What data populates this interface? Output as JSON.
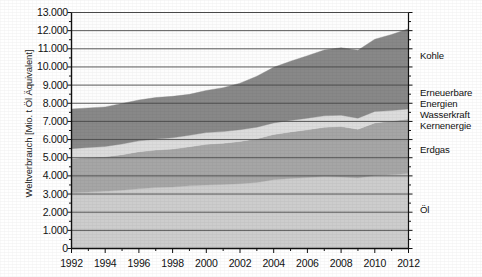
{
  "chart_data": {
    "type": "area",
    "title": "",
    "xlabel": "",
    "ylabel": "Weltverbrauch [Mio. t Öl Äquivalent]",
    "stacked": true,
    "grid": true,
    "legend_position": "right",
    "xlim": [
      1992,
      2012
    ],
    "ylim": [
      0,
      13000
    ],
    "ytick_labels": [
      "13.000",
      "12.000",
      "11.000",
      "10.000",
      "9.000",
      "8.000",
      "7.000",
      "6.000",
      "5.000",
      "4.000",
      "3.000",
      "2.000",
      "1.000",
      "0"
    ],
    "ytick_values": [
      13000,
      12000,
      11000,
      10000,
      9000,
      8000,
      7000,
      6000,
      5000,
      4000,
      3000,
      2000,
      1000,
      0
    ],
    "xtick_labels": [
      "1992",
      "1994",
      "1996",
      "1998",
      "2000",
      "2002",
      "2004",
      "2006",
      "2008",
      "2010",
      "2012"
    ],
    "xtick_values": [
      1992,
      1994,
      1996,
      1998,
      2000,
      2002,
      2004,
      2006,
      2008,
      2010,
      2012
    ],
    "x": [
      1992,
      1993,
      1994,
      1995,
      1996,
      1997,
      1998,
      1999,
      2000,
      2001,
      2002,
      2003,
      2004,
      2005,
      2006,
      2007,
      2008,
      2009,
      2010,
      2011,
      2012
    ],
    "series": [
      {
        "name": "Öl",
        "color": "#cdcdcd",
        "values": [
          3080,
          3110,
          3160,
          3210,
          3290,
          3360,
          3390,
          3450,
          3500,
          3530,
          3570,
          3640,
          3790,
          3860,
          3910,
          3960,
          3940,
          3890,
          4020,
          4060,
          4130
        ]
      },
      {
        "name": "Erdgas",
        "color": "#a6a6a6",
        "values": [
          1880,
          1900,
          1890,
          1960,
          2040,
          2060,
          2090,
          2150,
          2240,
          2270,
          2330,
          2410,
          2490,
          2560,
          2630,
          2720,
          2780,
          2680,
          2900,
          2960,
          3000
        ]
      },
      {
        "name": "Kernenergie",
        "color": "#dcdcdc",
        "values": [
          540,
          555,
          570,
          590,
          600,
          605,
          620,
          640,
          645,
          640,
          645,
          630,
          640,
          635,
          640,
          630,
          620,
          610,
          630,
          580,
          560
        ]
      },
      {
        "name": "Wasserkraft",
        "color": "#dcdcdc",
        "values": [
          0,
          0,
          0,
          0,
          0,
          0,
          0,
          0,
          0,
          0,
          0,
          0,
          0,
          0,
          0,
          0,
          0,
          0,
          0,
          0,
          0
        ]
      },
      {
        "name": "Erneuerbare Energien",
        "color": "#dcdcdc",
        "values": [
          0,
          0,
          0,
          0,
          0,
          0,
          0,
          0,
          0,
          0,
          0,
          0,
          0,
          0,
          0,
          0,
          0,
          0,
          0,
          0,
          0
        ]
      },
      {
        "name": "Kohle",
        "color": "#888888",
        "values": [
          2180,
          2180,
          2180,
          2230,
          2250,
          2290,
          2280,
          2250,
          2320,
          2420,
          2560,
          2810,
          3060,
          3260,
          3440,
          3620,
          3720,
          3740,
          3980,
          4190,
          4410
        ]
      }
    ],
    "totals": [
      8100,
      8200,
      8270,
      8420,
      8650,
      8760,
      8850,
      8960,
      9140,
      9290,
      9520,
      9880,
      10300,
      10600,
      10900,
      11240,
      11380,
      11200,
      11870,
      12140,
      12450
    ],
    "legend_entries": [
      {
        "label": "Kohle",
        "color": "#888888"
      },
      {
        "label": "Erneuerbare",
        "color": "#dcdcdc"
      },
      {
        "label": "Energien",
        "color": "#dcdcdc"
      },
      {
        "label": "Wasserkraft",
        "color": "#dcdcdc"
      },
      {
        "label": "Kernenergie",
        "color": "#dcdcdc"
      },
      {
        "label": "Erdgas",
        "color": "#a6a6a6"
      },
      {
        "label": "Öl",
        "color": "#cdcdcd"
      }
    ]
  },
  "axis": {
    "y_title": "Weltverbrauch [Mio. t Öl Äquivalent]"
  },
  "colors": {
    "kohle": "#888888",
    "mittel_band": "#dcdcdc",
    "erdgas": "#a6a6a6",
    "oel": "#cdcdcd",
    "axis": "#1a1a1a",
    "grid": "#555555",
    "background": "#ffffff"
  }
}
